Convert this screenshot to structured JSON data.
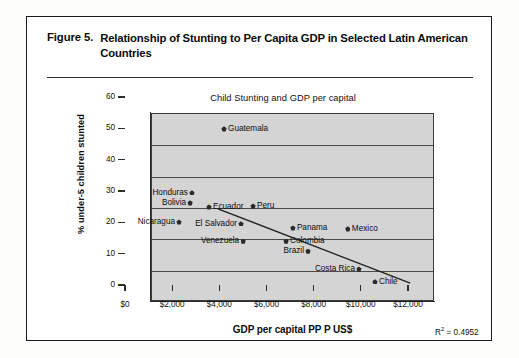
{
  "figure": {
    "label": "Figure 5.",
    "caption": "Relationship of Stunting to Per Capita GDP in Selected Latin American Countries"
  },
  "chart_data": {
    "type": "scatter",
    "title": "Child Stunting and GDP per capital",
    "xlabel": "GDP per capital PP P US$",
    "ylabel": "% under-5 children stunted",
    "xlim": [
      0,
      12000
    ],
    "ylim": [
      0,
      60
    ],
    "xticks": [
      "$0",
      "$2,000",
      "$4,000",
      "$6,000",
      "$8,000",
      "$10,000",
      "$12,000"
    ],
    "xtick_values": [
      0,
      2000,
      4000,
      6000,
      8000,
      10000,
      12000
    ],
    "yticks": [
      "0",
      "10",
      "20",
      "30",
      "40",
      "50",
      "60"
    ],
    "ytick_values": [
      0,
      10,
      20,
      30,
      40,
      50,
      60
    ],
    "grid": true,
    "legend": false,
    "annotation": "R2 = 0.4952",
    "annotation_r2_base": "R",
    "annotation_r2_sup": "2",
    "annotation_r2_value": " = 0.4952",
    "plot_bg_color": "#d4d4d4",
    "marker_color": "#2a2a2a",
    "trendline": {
      "x0": 2840,
      "y0": 29.4,
      "x1": 10990,
      "y1": 5.7
    },
    "points": [
      {
        "name": "Guatemala",
        "x": 4200,
        "y": 49.8,
        "label_side": "right"
      },
      {
        "name": "Honduras",
        "x": 2840,
        "y": 29.4,
        "label_side": "left"
      },
      {
        "name": "Bolivia",
        "x": 2760,
        "y": 26.2,
        "label_side": "left"
      },
      {
        "name": "Ecuador",
        "x": 3560,
        "y": 24.9,
        "label_side": "right"
      },
      {
        "name": "Peru",
        "x": 5430,
        "y": 25.2,
        "label_side": "right"
      },
      {
        "name": "Nicaragua",
        "x": 2290,
        "y": 20.1,
        "label_side": "left"
      },
      {
        "name": "El Salvador",
        "x": 4920,
        "y": 19.5,
        "label_side": "left"
      },
      {
        "name": "Panama",
        "x": 7120,
        "y": 18.2,
        "label_side": "right"
      },
      {
        "name": "Mexico",
        "x": 9450,
        "y": 17.9,
        "label_side": "right"
      },
      {
        "name": "Venezuela",
        "x": 5010,
        "y": 14.0,
        "label_side": "left"
      },
      {
        "name": "Colombia",
        "x": 6830,
        "y": 14.0,
        "label_side": "right"
      },
      {
        "name": "Brazil",
        "x": 7760,
        "y": 10.8,
        "label_side": "left"
      },
      {
        "name": "Costa Rica",
        "x": 9920,
        "y": 5.1,
        "label_side": "left"
      },
      {
        "name": "Chile",
        "x": 10600,
        "y": 1.0,
        "label_side": "right"
      }
    ]
  }
}
